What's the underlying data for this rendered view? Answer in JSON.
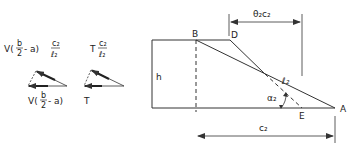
{
  "left_diagram_1": {
    "top_label": "V(b/2 - a) c₂/ℓ₂",
    "top_label_parts": {
      "prefix": "V(",
      "frac_num": "b",
      "frac_den": "2",
      "mid": " - a)",
      "ratio_num": "c₂",
      "ratio_den": "ℓ₂"
    },
    "bottom_label": "V(b/2 - a)",
    "bottom_label_parts": {
      "prefix": "V(",
      "frac_num": "b",
      "frac_den": "2",
      "suffix": " - a)"
    }
  },
  "left_diagram_2": {
    "top_label_parts": {
      "prefix": "T",
      "ratio_num": "c₂",
      "ratio_den": "ℓ₂"
    },
    "bottom_label": "T"
  },
  "main_diagram": {
    "points": {
      "A": "A",
      "B": "B",
      "D": "D",
      "E": "E"
    },
    "height_label": "h",
    "length_label": "ℓ₂",
    "angle_label": "α₂",
    "top_dimension": "θ₂c₂",
    "bottom_dimension": "c₂"
  },
  "colors": {
    "line": "#333333",
    "background": "#ffffff"
  }
}
